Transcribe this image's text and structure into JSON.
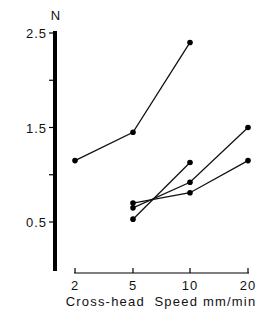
{
  "chart_data": {
    "type": "line",
    "title": "",
    "ylabel": "N",
    "xlabel": "Cross-head  Speed mm/min",
    "x_categories": [
      "2",
      "5",
      "10",
      "20"
    ],
    "y_ticks": [
      {
        "value": 2.5,
        "label": "2.5"
      },
      {
        "value": 2.0,
        "label": ""
      },
      {
        "value": 1.5,
        "label": "1.5"
      },
      {
        "value": 1.0,
        "label": ""
      },
      {
        "value": 0.5,
        "label": "0.5"
      }
    ],
    "ylim": [
      0.0,
      2.5
    ],
    "grid": false,
    "legend": "none",
    "series": [
      {
        "name": "series-1",
        "x": [
          "2",
          "5",
          "10"
        ],
        "values": [
          1.15,
          1.45,
          2.4
        ]
      },
      {
        "name": "series-2",
        "x": [
          "5",
          "10"
        ],
        "values": [
          0.53,
          1.13
        ]
      },
      {
        "name": "series-3",
        "x": [
          "5",
          "10",
          "20"
        ],
        "values": [
          0.65,
          0.92,
          1.5
        ]
      },
      {
        "name": "series-4",
        "x": [
          "5",
          "10",
          "20"
        ],
        "values": [
          0.7,
          0.81,
          1.15
        ]
      }
    ]
  }
}
